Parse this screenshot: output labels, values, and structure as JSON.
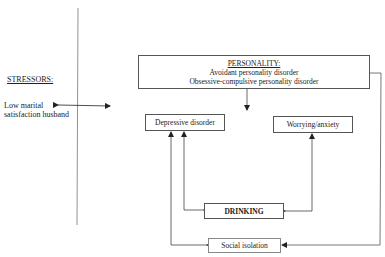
{
  "stressors": {
    "heading": "STRESSORS:",
    "items": [
      "Low marital",
      "satisfaction husband"
    ]
  },
  "personality": {
    "heading": "PERSONALITY:",
    "lines": [
      "Avoidant personality disorder",
      "Obsessive-compulsive personality disorder"
    ]
  },
  "nodes": {
    "depressive": "Depressive disorder",
    "worrying": "Worrying/anxiety",
    "drinking": "DRINKING",
    "social": "Social isolation"
  },
  "colors": {
    "line": "#555555",
    "text": "#222222",
    "background": "#ffffff"
  }
}
